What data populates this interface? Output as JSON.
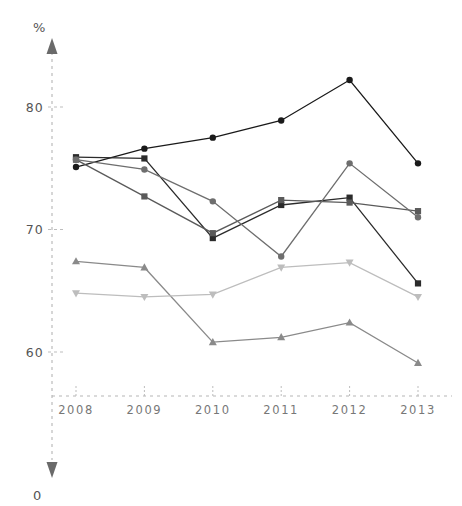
{
  "chart_data": {
    "type": "line",
    "title": "",
    "xlabel": "",
    "ylabel": "%",
    "zero_label": "0",
    "categories": [
      "2008",
      "2009",
      "2010",
      "2011",
      "2012",
      "2013"
    ],
    "x": [
      2008,
      2009,
      2010,
      2011,
      2012,
      2013
    ],
    "ylim": [
      57.0,
      83.5
    ],
    "ytick_labels": [
      "80",
      "70",
      "60"
    ],
    "yticks": [
      80,
      70,
      60
    ],
    "grid": "dashed-horizontal-ticks",
    "legend": "none",
    "axis_style": "dashed arrows",
    "series": [
      {
        "name": "series-1",
        "marker": "circle",
        "color": "#1a1a1a",
        "values": [
          75.1,
          76.6,
          77.5,
          78.9,
          82.2,
          75.4
        ]
      },
      {
        "name": "series-2",
        "marker": "square",
        "color": "#2b2b2b",
        "values": [
          75.9,
          75.8,
          69.3,
          72.0,
          72.6,
          65.6
        ]
      },
      {
        "name": "series-3",
        "marker": "square",
        "color": "#5a5a5a",
        "values": [
          75.7,
          72.7,
          69.7,
          72.4,
          72.2,
          71.5
        ]
      },
      {
        "name": "series-4",
        "marker": "circle",
        "color": "#6e6e6e",
        "values": [
          75.7,
          74.9,
          72.3,
          67.8,
          75.4,
          71.0
        ]
      },
      {
        "name": "series-5",
        "marker": "triangle-up",
        "color": "#8a8a8a",
        "values": [
          67.4,
          66.9,
          60.8,
          61.2,
          62.4,
          59.1
        ]
      },
      {
        "name": "series-6",
        "marker": "triangle-down",
        "color": "#bdbdbd",
        "values": [
          64.8,
          64.5,
          64.7,
          66.9,
          67.3,
          64.5
        ]
      }
    ]
  },
  "axes": {
    "y_unit_label": "%",
    "y_zero_label": "0",
    "y_tick_80": "80",
    "y_tick_70": "70",
    "y_tick_60": "60",
    "x_tick_2008": "2008",
    "x_tick_2009": "2009",
    "x_tick_2010": "2010",
    "x_tick_2011": "2011",
    "x_tick_2012": "2012",
    "x_tick_2013": "2013"
  },
  "colors": {
    "background": "#ffffff",
    "axis": "#b5b5b5",
    "arrow": "#6a6a6a",
    "tick_text": "#555555",
    "x_tick_text": "#777777"
  }
}
